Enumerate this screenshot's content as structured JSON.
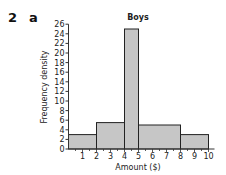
{
  "question": {
    "number": "2",
    "part": "a"
  },
  "chart_data": {
    "type": "bar",
    "subtype": "histogram",
    "title": "Boys",
    "xlabel": "Amount ($)",
    "ylabel": "Frequency density",
    "xlim": [
      0,
      10
    ],
    "ylim": [
      0,
      26
    ],
    "x_ticks": [
      1,
      2,
      3,
      4,
      5,
      6,
      7,
      8,
      9,
      10
    ],
    "y_ticks": [
      0,
      2,
      4,
      6,
      8,
      10,
      12,
      14,
      16,
      18,
      20,
      22,
      24,
      26
    ],
    "bins": [
      {
        "from": 0,
        "to": 2,
        "value": 3
      },
      {
        "from": 2,
        "to": 4,
        "value": 5.5
      },
      {
        "from": 4,
        "to": 5,
        "value": 25
      },
      {
        "from": 5,
        "to": 8,
        "value": 5
      },
      {
        "from": 8,
        "to": 10,
        "value": 3
      }
    ],
    "grid": false,
    "legend": null,
    "colors": {
      "bar_fill": "#c6c6c6",
      "bar_stroke": "#222222",
      "axis": "#333333"
    }
  }
}
